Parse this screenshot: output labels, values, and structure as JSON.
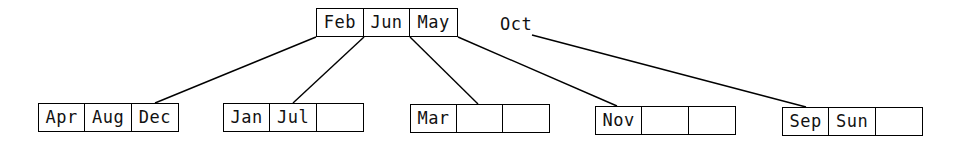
{
  "diagram": {
    "type": "b-tree",
    "root": {
      "id": "root",
      "keys": [
        "Feb",
        "Jun",
        "May"
      ],
      "box": {
        "x": 316,
        "y": 8,
        "w": 142,
        "h": 29
      }
    },
    "pending_key": {
      "label": "Oct",
      "x": 500,
      "y": 14
    },
    "children": [
      {
        "id": "child-0",
        "keys": [
          "Apr",
          "Aug",
          "Dec"
        ],
        "box": {
          "x": 38,
          "y": 103,
          "w": 141,
          "h": 29
        }
      },
      {
        "id": "child-1",
        "keys": [
          "Jan",
          "Jul",
          ""
        ],
        "box": {
          "x": 223,
          "y": 103,
          "w": 141,
          "h": 29
        }
      },
      {
        "id": "child-2",
        "keys": [
          "Mar",
          "",
          ""
        ],
        "box": {
          "x": 410,
          "y": 104,
          "w": 140,
          "h": 29
        }
      },
      {
        "id": "child-3",
        "keys": [
          "Nov",
          "",
          ""
        ],
        "box": {
          "x": 595,
          "y": 106,
          "w": 141,
          "h": 29
        }
      },
      {
        "id": "child-4",
        "keys": [
          "Sep",
          "Sun",
          ""
        ],
        "box": {
          "x": 782,
          "y": 107,
          "w": 141,
          "h": 29
        }
      }
    ],
    "edges": [
      {
        "from": "root",
        "to": "child-0",
        "x1": 316,
        "y1": 37,
        "x2": 155,
        "y2": 103
      },
      {
        "from": "root",
        "to": "child-1",
        "x1": 364,
        "y1": 37,
        "x2": 293,
        "y2": 103
      },
      {
        "from": "root",
        "to": "child-2",
        "x1": 410,
        "y1": 37,
        "x2": 478,
        "y2": 104
      },
      {
        "from": "root",
        "to": "child-3",
        "x1": 458,
        "y1": 37,
        "x2": 617,
        "y2": 106
      },
      {
        "from": "pending-key",
        "to": "child-4",
        "x1": 532,
        "y1": 35,
        "x2": 806,
        "y2": 107
      }
    ],
    "colors": {
      "stroke": "#000000",
      "text": "#111111",
      "background": "#ffffff"
    }
  }
}
